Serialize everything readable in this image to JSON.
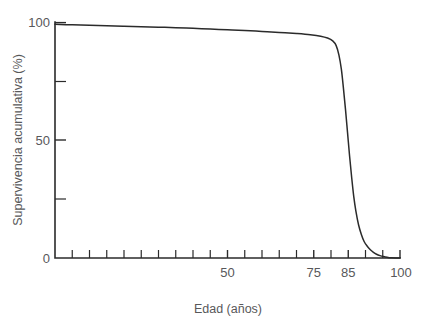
{
  "chart_data": {
    "type": "line",
    "title": "",
    "subtitle": "",
    "xlabel": "Edad (años)",
    "ylabel": "Supervivencia acumulativa (%)",
    "xlim": [
      0,
      100
    ],
    "ylim": [
      0,
      100
    ],
    "grid": false,
    "legend": null,
    "legend_position": "none",
    "annotations": [],
    "x_ticks": [
      0,
      5,
      10,
      15,
      20,
      25,
      30,
      35,
      40,
      45,
      50,
      55,
      60,
      65,
      70,
      75,
      80,
      85,
      90,
      95,
      100
    ],
    "x_tick_labels": [
      "",
      "",
      "",
      "",
      "",
      "",
      "",
      "",
      "",
      "",
      "50",
      "",
      "",
      "",
      "",
      "75",
      "",
      "85",
      "",
      "",
      "100"
    ],
    "x_labeled_ticks": [
      {
        "value": 50,
        "label": "50"
      },
      {
        "value": 75,
        "label": "75"
      },
      {
        "value": 85,
        "label": "85"
      },
      {
        "value": 100,
        "label": "100"
      }
    ],
    "y_ticks": [
      0,
      25,
      50,
      75,
      100
    ],
    "y_tick_labels": [
      "0",
      "",
      "50",
      "",
      "100"
    ],
    "y_labeled_ticks": [
      {
        "value": 0,
        "label": "0"
      },
      {
        "value": 50,
        "label": "50"
      },
      {
        "value": 100,
        "label": "100"
      }
    ],
    "series": [
      {
        "name": "Supervivencia acumulativa",
        "color": "#2b2b2b",
        "x": [
          0,
          5,
          10,
          15,
          20,
          25,
          30,
          35,
          40,
          45,
          50,
          55,
          60,
          65,
          70,
          74,
          77,
          79,
          80.5,
          81.5,
          82.3,
          83,
          83.6,
          84.2,
          84.8,
          85.4,
          86,
          86.6,
          87.2,
          88,
          88.8,
          89.6,
          90.5,
          91.4,
          92.3,
          93.2,
          94.2,
          95.2,
          96.3,
          97.5,
          100
        ],
        "y": [
          99,
          98.8,
          98.6,
          98.4,
          98.2,
          98,
          97.8,
          97.6,
          97.3,
          97,
          96.7,
          96.4,
          96,
          95.6,
          95.1,
          94.6,
          94,
          93.2,
          92,
          90,
          86,
          80,
          72,
          63,
          53,
          43,
          34,
          26,
          20,
          14,
          10,
          7,
          5,
          3.5,
          2.4,
          1.6,
          1,
          0.6,
          0.3,
          0.1,
          0
        ]
      }
    ],
    "colors": {
      "line": "#2b2b2b",
      "axis": "#2b2b2b",
      "text": "#58585a",
      "background": "#ffffff"
    }
  },
  "layout": {
    "plot": {
      "left": 55,
      "right": 400,
      "top": 22,
      "bottom": 258
    }
  }
}
